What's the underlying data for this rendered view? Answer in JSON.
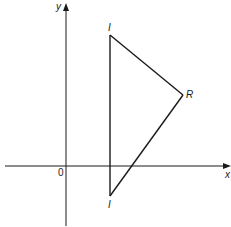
{
  "diagram": {
    "type": "coordinate-geometry",
    "axes": {
      "x_label": "x",
      "y_label": "y",
      "origin_label": "0"
    },
    "triangle": {
      "vertices": [
        {
          "id": "top",
          "label": "I"
        },
        {
          "id": "right",
          "label": "R"
        },
        {
          "id": "bottom",
          "label": "I"
        }
      ],
      "edges": [
        {
          "from": "top",
          "to": "right"
        },
        {
          "from": "right",
          "to": "bottom"
        },
        {
          "from": "bottom",
          "to": "top"
        }
      ]
    },
    "colors": {
      "ink": "#1a1a1a",
      "background": "#ffffff"
    }
  }
}
